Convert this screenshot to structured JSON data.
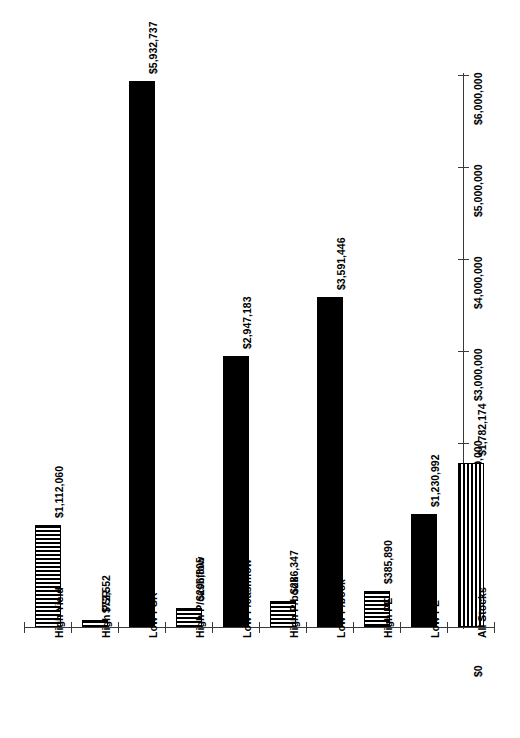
{
  "chart_data": {
    "type": "bar",
    "title": "",
    "subtitle": "",
    "xlabel": "",
    "ylabel": "",
    "orientation": "vertical-bars-on-rotated-page",
    "grid": false,
    "legend": "none",
    "ylim": [
      0,
      6000000
    ],
    "categories": [
      "High Yield",
      "High PSR",
      "Low PSR",
      "High P/cashflow",
      "Low P/cashflow",
      "High P/book",
      "Low P/book",
      "High PE",
      "Low PE",
      "All Stocks"
    ],
    "values": [
      1112060,
      72552,
      5932737,
      206805,
      2947183,
      286347,
      3591446,
      385890,
      1230992,
      1782174
    ],
    "value_labels": [
      "$1,112,060",
      "$72,552",
      "$5,932,737",
      "$206,805",
      "$2,947,183",
      "$286,347",
      "$3,591,446",
      "$385,890",
      "$1,230,992",
      "$1,782,174"
    ],
    "bar_fills": [
      "horizontal-stripes",
      "horizontal-stripes",
      "solid-black",
      "horizontal-stripes",
      "solid-black",
      "horizontal-stripes",
      "solid-black",
      "horizontal-stripes",
      "solid-black",
      "vertical-stripes"
    ],
    "axis_ticks": [
      0,
      1000000,
      2000000,
      3000000,
      4000000,
      5000000,
      6000000
    ],
    "axis_tick_labels": [
      "$0",
      "$1,000,000",
      "$2,000,000",
      "$3,000,000",
      "$4,000,000",
      "$5,000,000",
      "$6,000,000"
    ],
    "colors": {
      "bar": "#000000",
      "axis": "#3a3a3a",
      "text": "#000000",
      "background": "#ffffff"
    }
  }
}
